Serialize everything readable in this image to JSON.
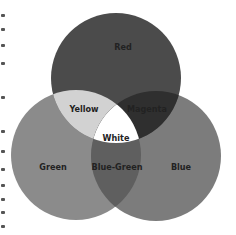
{
  "diagram": {
    "type": "venn-additive-color",
    "circles": [
      {
        "name": "Red",
        "cx": 116,
        "cy": 78,
        "r": 65,
        "fill": "#4b4b4b"
      },
      {
        "name": "Green",
        "cx": 76,
        "cy": 155,
        "r": 65,
        "fill": "#8b8b8b"
      },
      {
        "name": "Blue",
        "cx": 156,
        "cy": 156,
        "r": 65,
        "fill": "#7c7c7c"
      }
    ],
    "overlaps": {
      "yellow": {
        "fill": "#d2d2d2"
      },
      "magenta": {
        "fill": "#2f2f2f"
      },
      "blue_green": {
        "fill": "#5f5f5f"
      },
      "white": {
        "fill": "#ffffff"
      }
    },
    "labels": {
      "red": "Red",
      "yellow": "Yellow",
      "magenta": "Magenta",
      "white": "White",
      "green": "Green",
      "blue_green": "Blue-Green",
      "blue": "Blue"
    }
  }
}
